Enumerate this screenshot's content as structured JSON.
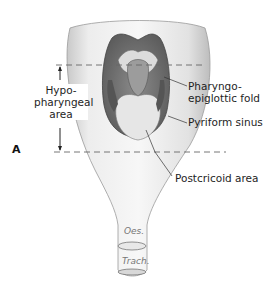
{
  "figure": {
    "letter": "A",
    "bracket_label_lines": [
      "Hypo-",
      "pharyngeal",
      "area"
    ],
    "labels": {
      "pharyngo_epiglottic_line1": "Pharyngo-",
      "pharyngo_epiglottic_line2": "epiglottic fold",
      "pyriform_sinus": "Pyriform sinus",
      "postcricoid_area": "Postcricoid area",
      "oesophagus": "Oes.",
      "trachea": "Trach."
    }
  }
}
